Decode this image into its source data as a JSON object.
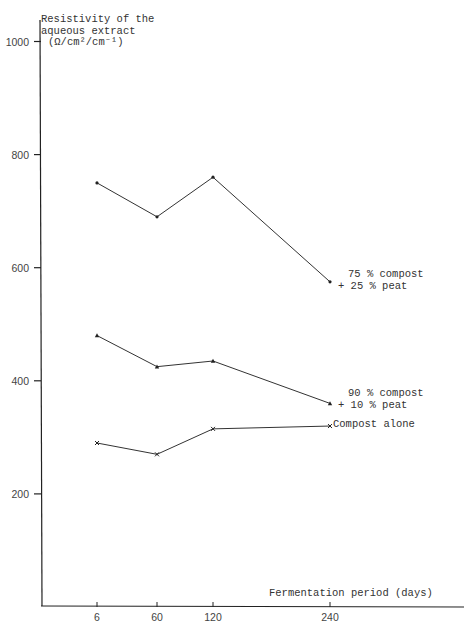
{
  "chart_data": {
    "type": "line",
    "title": "",
    "ylabel": "Resistivity of the aqueous extract (Ω/cm²/cm⁻¹)",
    "ylabel_lines": [
      "Resistivity of the",
      "aqueous extract",
      "(Ω/cm²/cm⁻¹)"
    ],
    "xlabel": "Fermentation period (days)",
    "x": [
      6,
      60,
      120,
      240
    ],
    "x_tick_labels": [
      "6",
      "60",
      "120",
      "240"
    ],
    "y_ticks": [
      200,
      400,
      600,
      800,
      1000
    ],
    "y_tick_labels": [
      "200",
      "400",
      "600",
      "800",
      "1000"
    ],
    "ylim": [
      0,
      1000
    ],
    "grid": false,
    "legend_position": "inline labels at right end of each line",
    "series": [
      {
        "name": "75 % compost + 25 % peat",
        "label_lines": [
          "75 % compost",
          "+ 25 % peat"
        ],
        "marker": "dot",
        "values": [
          750,
          690,
          760,
          575
        ]
      },
      {
        "name": "90 % compost + 10 % peat",
        "label_lines": [
          "90 % compost",
          "+ 10 % peat"
        ],
        "marker": "triangle",
        "values": [
          480,
          425,
          435,
          360
        ]
      },
      {
        "name": "Compost alone",
        "label_lines": [
          "Compost alone"
        ],
        "marker": "cross",
        "values": [
          290,
          270,
          315,
          320
        ]
      }
    ]
  },
  "colors": {
    "line": "#333333",
    "axis": "#222222",
    "background": "#ffffff"
  }
}
